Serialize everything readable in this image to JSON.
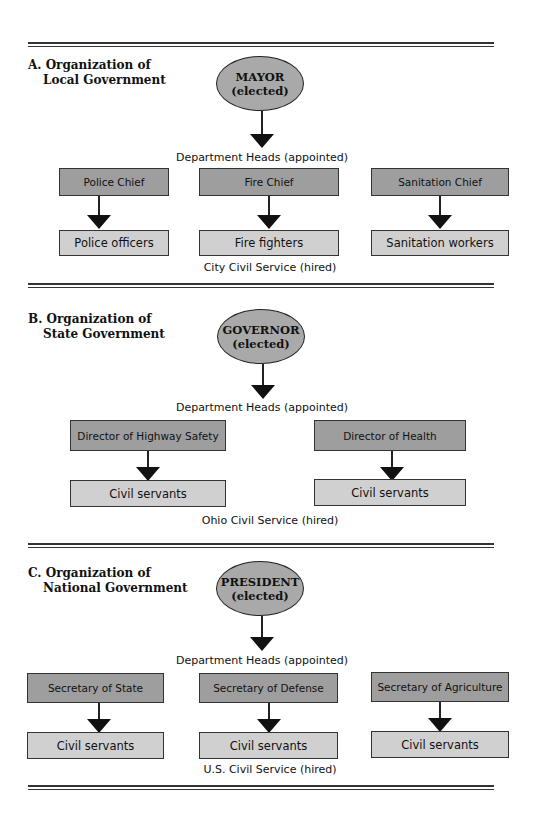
{
  "colors": {
    "head_box": "#9e9e9e",
    "worker_box": "#d0d0d0",
    "ellipse": "#a9a9a9",
    "line": "#222222"
  },
  "sections": [
    {
      "title_line1": "A. Organization of",
      "title_line2": "Local Government",
      "leader": "MAYOR",
      "leader_note": "(elected)",
      "heads_caption": "Department Heads (appointed)",
      "departments": [
        {
          "head": "Police Chief",
          "workers": "Police officers"
        },
        {
          "head": "Fire Chief",
          "workers": "Fire fighters"
        },
        {
          "head": "Sanitation Chief",
          "workers": "Sanitation workers"
        }
      ],
      "service_caption": "City Civil Service (hired)"
    },
    {
      "title_line1": "B. Organization of",
      "title_line2": "State Government",
      "leader": "GOVERNOR",
      "leader_note": "(elected)",
      "heads_caption": "Department Heads (appointed)",
      "departments": [
        {
          "head": "Director of Highway Safety",
          "workers": "Civil servants"
        },
        {
          "head": "Director of Health",
          "workers": "Civil servants"
        }
      ],
      "service_caption": "Ohio Civil Service (hired)"
    },
    {
      "title_line1": "C. Organization of",
      "title_line2": "National Government",
      "leader": "PRESIDENT",
      "leader_note": "(elected)",
      "heads_caption": "Department Heads (appointed)",
      "departments": [
        {
          "head": "Secretary of State",
          "workers": "Civil servants"
        },
        {
          "head": "Secretary of Defense",
          "workers": "Civil servants"
        },
        {
          "head": "Secretary of Agriculture",
          "workers": "Civil servants"
        }
      ],
      "service_caption": "U.S. Civil Service (hired)"
    }
  ]
}
